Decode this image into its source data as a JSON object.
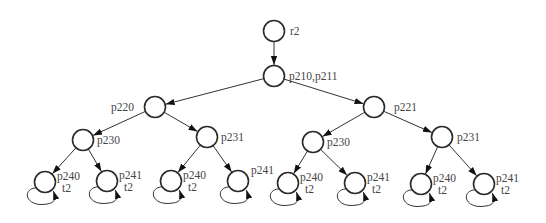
{
  "diagram": {
    "type": "state-tree",
    "colors": {
      "stroke": "#2a2a2a",
      "text": "#444444",
      "background": "#ffffff"
    },
    "nodes": [
      {
        "id": "r2",
        "labels": [
          "r2"
        ],
        "self_loop": false
      },
      {
        "id": "p210",
        "labels": [
          "p210,p211"
        ],
        "self_loop": false
      },
      {
        "id": "p220",
        "labels": [
          "p220"
        ],
        "self_loop": false
      },
      {
        "id": "p221",
        "labels": [
          "p221"
        ],
        "self_loop": false
      },
      {
        "id": "p230a",
        "labels": [
          "p230"
        ],
        "self_loop": false
      },
      {
        "id": "p231a",
        "labels": [
          "p231"
        ],
        "self_loop": false
      },
      {
        "id": "p230b",
        "labels": [
          "p230"
        ],
        "self_loop": false
      },
      {
        "id": "p231b",
        "labels": [
          "p231"
        ],
        "self_loop": false
      },
      {
        "id": "l1",
        "labels": [
          "p240",
          "t2"
        ],
        "self_loop": true
      },
      {
        "id": "l2",
        "labels": [
          "p241",
          "t2"
        ],
        "self_loop": true
      },
      {
        "id": "l3",
        "labels": [
          "p240",
          "t2"
        ],
        "self_loop": true
      },
      {
        "id": "l4",
        "labels": [
          "p241"
        ],
        "self_loop": true
      },
      {
        "id": "l5",
        "labels": [
          "p240",
          "t2"
        ],
        "self_loop": true
      },
      {
        "id": "l6",
        "labels": [
          "p241",
          "t2"
        ],
        "self_loop": true
      },
      {
        "id": "l7",
        "labels": [
          "p240",
          "t2"
        ],
        "self_loop": true
      },
      {
        "id": "l8",
        "labels": [
          "p241",
          "t2"
        ],
        "self_loop": true
      }
    ],
    "edges": [
      {
        "from": "r2",
        "to": "p210"
      },
      {
        "from": "p210",
        "to": "p220"
      },
      {
        "from": "p210",
        "to": "p221"
      },
      {
        "from": "p220",
        "to": "p230a"
      },
      {
        "from": "p220",
        "to": "p231a"
      },
      {
        "from": "p221",
        "to": "p230b"
      },
      {
        "from": "p221",
        "to": "p231b"
      },
      {
        "from": "p230a",
        "to": "l1"
      },
      {
        "from": "p230a",
        "to": "l2"
      },
      {
        "from": "p231a",
        "to": "l3"
      },
      {
        "from": "p231a",
        "to": "l4"
      },
      {
        "from": "p230b",
        "to": "l5"
      },
      {
        "from": "p230b",
        "to": "l6"
      },
      {
        "from": "p231b",
        "to": "l7"
      },
      {
        "from": "p231b",
        "to": "l8"
      }
    ]
  }
}
